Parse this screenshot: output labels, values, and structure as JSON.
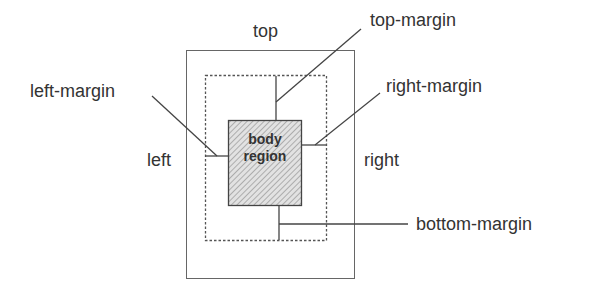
{
  "diagram": {
    "labels": {
      "top": "top",
      "left": "left",
      "right": "right",
      "top_margin": "top-margin",
      "left_margin": "left-margin",
      "right_margin": "right-margin",
      "bottom_margin": "bottom-margin",
      "body_line1": "body",
      "body_line2": "region"
    },
    "colors": {
      "line": "#555555",
      "text": "#333333",
      "hatch": "#888888",
      "body_fill": "#dddddd"
    }
  }
}
